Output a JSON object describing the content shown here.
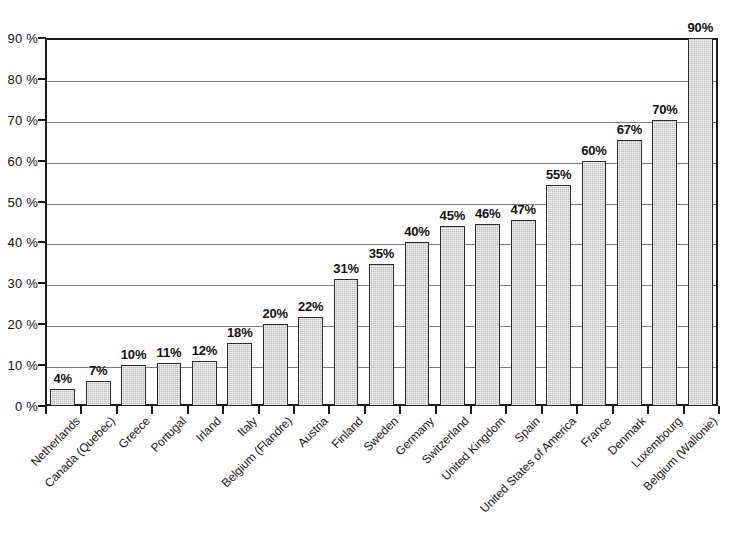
{
  "chart_data": {
    "type": "bar",
    "title": "",
    "subtitle": "",
    "xlabel": "",
    "ylabel": "",
    "ylim": [
      0,
      90
    ],
    "ytick_step": 10,
    "grid": true,
    "legend": "none",
    "orientation": "vertical",
    "value_label_suffix": "%",
    "axis_label_suffix": " %",
    "sorted": "ascending",
    "categories": [
      "Netherlands",
      "Canada (Quebec)",
      "Greece",
      "Portugal",
      "Irland",
      "Italy",
      "Belgium (Flandre)",
      "Austria",
      "Finland",
      "Sweden",
      "Germany",
      "Switzerland",
      "United Kingdom",
      "Spain",
      "United States of America",
      "France",
      "Denmark",
      "Luxembourg",
      "Belgium (Wallonie)"
    ],
    "values": [
      4,
      7,
      10,
      11,
      12,
      18,
      20,
      22,
      31,
      35,
      40,
      45,
      46,
      47,
      55,
      60,
      67,
      70,
      90
    ],
    "drawn_heights": [
      4.2,
      6.0,
      10.0,
      10.5,
      11.0,
      15.5,
      20.0,
      21.8,
      31.0,
      34.8,
      40.0,
      44.0,
      44.5,
      45.5,
      54.0,
      60.0,
      65.0,
      70.0,
      90.0
    ],
    "data_labels": [
      "4%",
      "7%",
      "10%",
      "11%",
      "12%",
      "18%",
      "20%",
      "22%",
      "31%",
      "35%",
      "40%",
      "45%",
      "46%",
      "47%",
      "55%",
      "60%",
      "67%",
      "70%",
      "90%"
    ],
    "ytick_labels": [
      "0 %",
      "10 %",
      "20 %",
      "30 %",
      "40 %",
      "50 %",
      "60 %",
      "70 %",
      "80 %",
      "90 %"
    ],
    "ytick_values": [
      0,
      10,
      20,
      30,
      40,
      50,
      60,
      70,
      80,
      90
    ],
    "colors": {
      "bar_fill": "#bdbdbd",
      "bar_border": "#2b2b2b",
      "gridline": "#7d7d7d",
      "axis": "#1a1a1a",
      "background": "#ffffff",
      "text": "#111111"
    }
  }
}
